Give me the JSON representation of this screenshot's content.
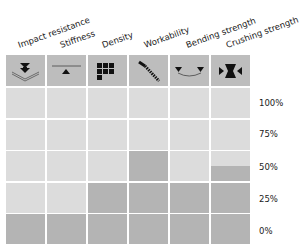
{
  "chart_data": {
    "type": "bar",
    "title": "",
    "xlabel": "",
    "ylabel": "",
    "categories": [
      "Impact resistance",
      "Stiffness",
      "Density",
      "Workability",
      "Bending strength",
      "Crushing strength"
    ],
    "icons": [
      "impact-icon",
      "stiffness-icon",
      "density-icon",
      "workability-icon",
      "bending-icon",
      "crushing-icon"
    ],
    "values": [
      0,
      0,
      25,
      50,
      25,
      37.5
    ],
    "y_ticks": [
      "100%",
      "75%",
      "50%",
      "25%",
      "0%"
    ],
    "ylim": [
      0,
      100
    ],
    "grid": true,
    "colors": {
      "empty": "#dcdcdc",
      "filled": "#b4b4b4",
      "header": "#bdbdbd"
    }
  }
}
